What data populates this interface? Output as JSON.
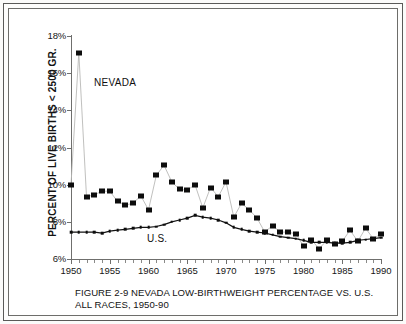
{
  "figure": {
    "caption_line1": "FIGURE 2-9  NEVADA LOW-BIRTHWEIGHT PERCENTAGE VS. U.S.",
    "caption_line2": "ALL RACES, 1950-90"
  },
  "chart_data": {
    "type": "line",
    "title": "FIGURE 2-9  NEVADA LOW-BIRTHWEIGHT PERCENTAGE VS. U.S. ALL RACES, 1950-90",
    "xlabel": "",
    "ylabel": "PERCENT OF LIVE BIRTHS < 2500 GR.",
    "xlim": [
      1950,
      1990
    ],
    "ylim": [
      6,
      18
    ],
    "xticks": [
      1950,
      1955,
      1960,
      1965,
      1970,
      1975,
      1980,
      1985,
      1990
    ],
    "xticklabels": [
      "1950",
      "1955",
      "1960",
      "1965",
      "1970",
      "1975",
      "1980",
      "1985",
      "1990"
    ],
    "yticks": [
      6,
      8,
      10,
      12,
      14,
      16,
      18
    ],
    "yticklabels": [
      "6%",
      "8%",
      "10%",
      "12%",
      "14%",
      "16%",
      "18%"
    ],
    "minor_xtick_interval": 1,
    "grid": false,
    "legend": "inline-annotations",
    "annotations": [
      {
        "text": "NEVADA",
        "series": "NEVADA",
        "x": 1953.5,
        "y": 15.2
      },
      {
        "text": "U.S.",
        "series": "U.S.",
        "x": 1960.0,
        "y": 6.9
      }
    ],
    "x": [
      1950,
      1951,
      1952,
      1953,
      1954,
      1955,
      1956,
      1957,
      1958,
      1959,
      1960,
      1961,
      1962,
      1963,
      1964,
      1965,
      1966,
      1967,
      1968,
      1969,
      1970,
      1971,
      1972,
      1973,
      1974,
      1975,
      1976,
      1977,
      1978,
      1979,
      1980,
      1981,
      1982,
      1983,
      1984,
      1985,
      1986,
      1987,
      1988,
      1989,
      1990
    ],
    "series": [
      {
        "name": "NEVADA",
        "marker": "filled-square",
        "values": [
          10.0,
          17.1,
          9.35,
          9.45,
          9.65,
          9.65,
          9.1,
          8.9,
          9.0,
          9.4,
          8.65,
          10.5,
          11.05,
          10.15,
          9.75,
          9.7,
          10.0,
          8.75,
          9.85,
          9.35,
          10.15,
          8.25,
          9.0,
          8.65,
          8.2,
          7.45,
          7.8,
          7.45,
          7.45,
          7.35,
          6.7,
          7.05,
          6.55,
          7.0,
          6.8,
          6.95,
          7.55,
          6.95,
          7.65,
          7.1,
          7.35
        ]
      },
      {
        "name": "U.S.",
        "marker": "small-dot",
        "values": [
          7.45,
          7.45,
          7.45,
          7.45,
          7.4,
          7.5,
          7.55,
          7.6,
          7.65,
          7.7,
          7.7,
          7.75,
          7.85,
          8.0,
          8.1,
          8.2,
          8.35,
          8.25,
          8.2,
          8.1,
          7.95,
          7.7,
          7.6,
          7.5,
          7.45,
          7.4,
          7.3,
          7.2,
          7.15,
          7.1,
          7.0,
          6.9,
          6.9,
          6.9,
          6.85,
          6.85,
          6.9,
          7.0,
          7.05,
          7.1,
          7.15
        ]
      }
    ]
  }
}
